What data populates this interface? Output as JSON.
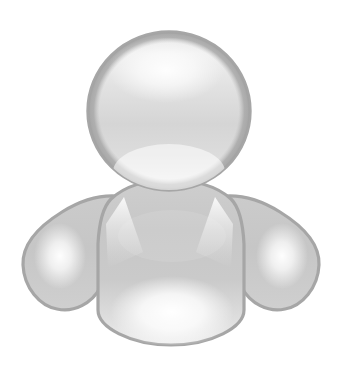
{
  "canvas": {
    "width": 344,
    "height": 371,
    "background_color": "#ffffff"
  },
  "icon": {
    "name": "user-avatar-icon",
    "semantic_label": "user-avatar-icon",
    "description": "Generic grayscale buddy / user avatar silhouette",
    "alt_text": "User avatar",
    "style": "glossy grayscale silhouette"
  },
  "palette": {
    "background": "#ffffff",
    "outline": "#a6a6a6",
    "outline_soft": "#b5b5b5",
    "body_fill_light": "#d6d6d6",
    "body_fill_mid": "#c9c9c9",
    "body_fill_dark": "#bdbdbd",
    "head_fill_light": "#ededed",
    "head_fill_mid": "#dcdcdc",
    "head_fill_dark": "#cccccc",
    "highlight": "#ffffff",
    "highlight_soft": "#f4f4f4"
  },
  "geometry": {
    "head": {
      "name": "avatar-head",
      "center_x": 169,
      "center_y": 111,
      "radius_x": 81,
      "radius_y": 79,
      "bounds": {
        "left": 88,
        "top": 32,
        "right": 250,
        "bottom": 190
      }
    },
    "body": {
      "name": "avatar-body",
      "bounds": {
        "left": 22,
        "top": 180,
        "right": 320,
        "bottom": 345
      },
      "torso_left": 106,
      "torso_right": 234,
      "torso_bottom": 345
    },
    "left_arm": {
      "name": "avatar-left-arm",
      "bounds": {
        "left": 22,
        "top": 196,
        "right": 112,
        "bottom": 312
      }
    },
    "right_arm": {
      "name": "avatar-right-arm",
      "bounds": {
        "left": 228,
        "top": 196,
        "right": 320,
        "bottom": 312
      }
    },
    "head_highlight": {
      "name": "head-gloss-highlight",
      "center_x": 166,
      "center_y": 70,
      "radius_x": 58,
      "radius_y": 33
    },
    "torso_highlight": {
      "name": "torso-gloss-highlight",
      "center_x": 172,
      "center_y": 312,
      "radius_x": 62,
      "radius_y": 36
    },
    "left_arm_highlight": {
      "name": "left-arm-gloss-highlight",
      "center_x": 60,
      "center_y": 256,
      "radius_x": 26,
      "radius_y": 33
    },
    "right_arm_highlight": {
      "name": "right-arm-gloss-highlight",
      "center_x": 282,
      "center_y": 256,
      "radius_x": 26,
      "radius_y": 33
    },
    "collar_left_notch": {
      "name": "collar-left-notch",
      "apex_x": 124,
      "apex_y": 197
    },
    "collar_right_notch": {
      "name": "collar-right-notch",
      "apex_x": 215,
      "apex_y": 197
    }
  }
}
